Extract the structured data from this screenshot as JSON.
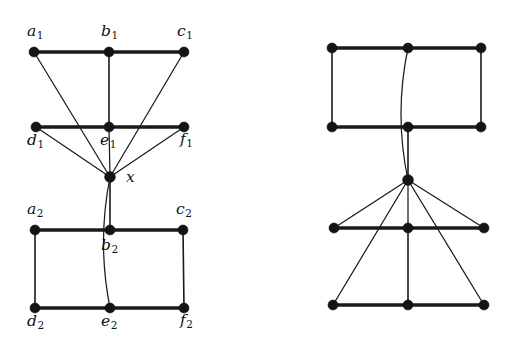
{
  "figure": {
    "background_color": "#ffffff",
    "ink_color": "#141414",
    "graphs": [
      {
        "id": "left-graph",
        "name": "labeled-graph",
        "labeled": true,
        "vertices": [
          {
            "id": "a1",
            "label": "a",
            "subscript": "1",
            "cx": 34,
            "cy": 52,
            "label_x": 27,
            "label_y": 24,
            "r": 5.0
          },
          {
            "id": "b1",
            "label": "b",
            "subscript": "1",
            "cx": 109,
            "cy": 52,
            "label_x": 101,
            "label_y": 24,
            "r": 5.0
          },
          {
            "id": "c1",
            "label": "c",
            "subscript": "1",
            "cx": 184,
            "cy": 52,
            "label_x": 177,
            "label_y": 24,
            "r": 5.0
          },
          {
            "id": "d1",
            "label": "d",
            "subscript": "1",
            "cx": 36,
            "cy": 127,
            "label_x": 27,
            "label_y": 133,
            "r": 5.0
          },
          {
            "id": "e1",
            "label": "e",
            "subscript": "1",
            "cx": 109,
            "cy": 127,
            "label_x": 100,
            "label_y": 133,
            "r": 5.0
          },
          {
            "id": "f1",
            "label": "f",
            "subscript": "1",
            "cx": 184,
            "cy": 127,
            "label_x": 180,
            "label_y": 132,
            "r": 5.0
          },
          {
            "id": "x",
            "label": "x",
            "subscript": "",
            "cx": 110,
            "cy": 177,
            "label_x": 126,
            "label_y": 170,
            "r": 5.4
          },
          {
            "id": "a2",
            "label": "a",
            "subscript": "2",
            "cx": 35,
            "cy": 230,
            "label_x": 27,
            "label_y": 202,
            "r": 5.0
          },
          {
            "id": "b2",
            "label": "b",
            "subscript": "2",
            "cx": 110,
            "cy": 230,
            "label_x": 101,
            "label_y": 238,
            "r": 5.0
          },
          {
            "id": "c2",
            "label": "c",
            "subscript": "2",
            "cx": 183,
            "cy": 230,
            "label_x": 176,
            "label_y": 202,
            "r": 5.0
          },
          {
            "id": "d2",
            "label": "d",
            "subscript": "2",
            "cx": 35,
            "cy": 308,
            "label_x": 27,
            "label_y": 314,
            "r": 5.0
          },
          {
            "id": "e2",
            "label": "e",
            "subscript": "2",
            "cx": 110,
            "cy": 308,
            "label_x": 101,
            "label_y": 314,
            "r": 5.0
          },
          {
            "id": "f2",
            "label": "f",
            "subscript": "2",
            "cx": 184,
            "cy": 308,
            "label_x": 180,
            "label_y": 313,
            "r": 5.0
          }
        ],
        "edges": [
          {
            "from": "a1",
            "to": "b1",
            "style": "thick",
            "shape": "line"
          },
          {
            "from": "b1",
            "to": "c1",
            "style": "thick",
            "shape": "line"
          },
          {
            "from": "b1",
            "to": "e1",
            "style": "medium",
            "shape": "line"
          },
          {
            "from": "d1",
            "to": "e1",
            "style": "thick",
            "shape": "line"
          },
          {
            "from": "e1",
            "to": "f1",
            "style": "thick",
            "shape": "line"
          },
          {
            "from": "a1",
            "to": "x",
            "style": "thin",
            "shape": "line"
          },
          {
            "from": "c1",
            "to": "x",
            "style": "thin",
            "shape": "line"
          },
          {
            "from": "d1",
            "to": "x",
            "style": "thin",
            "shape": "line"
          },
          {
            "from": "e1",
            "to": "x",
            "style": "thin",
            "shape": "line"
          },
          {
            "from": "f1",
            "to": "x",
            "style": "thin",
            "shape": "line"
          },
          {
            "from": "x",
            "to": "b2",
            "style": "medium",
            "shape": "line"
          },
          {
            "from": "x",
            "to": "e2",
            "style": "thin",
            "shape": "curve",
            "bow": -13
          },
          {
            "from": "a2",
            "to": "b2",
            "style": "thick",
            "shape": "line"
          },
          {
            "from": "b2",
            "to": "c2",
            "style": "thick",
            "shape": "line"
          },
          {
            "from": "a2",
            "to": "d2",
            "style": "medium",
            "shape": "line"
          },
          {
            "from": "c2",
            "to": "f2",
            "style": "medium",
            "shape": "line"
          },
          {
            "from": "d2",
            "to": "e2",
            "style": "thick",
            "shape": "line"
          },
          {
            "from": "e2",
            "to": "f2",
            "style": "thick",
            "shape": "line"
          }
        ]
      },
      {
        "id": "right-graph",
        "name": "unlabeled-graph",
        "labeled": false,
        "vertices": [
          {
            "id": "r_a1",
            "label": "",
            "subscript": "",
            "cx": 332,
            "cy": 48,
            "r": 5.0
          },
          {
            "id": "r_b1",
            "label": "",
            "subscript": "",
            "cx": 408,
            "cy": 48,
            "r": 5.0
          },
          {
            "id": "r_c1",
            "label": "",
            "subscript": "",
            "cx": 481,
            "cy": 48,
            "r": 5.0
          },
          {
            "id": "r_d1",
            "label": "",
            "subscript": "",
            "cx": 332,
            "cy": 127,
            "r": 5.0
          },
          {
            "id": "r_e1",
            "label": "",
            "subscript": "",
            "cx": 408,
            "cy": 127,
            "r": 5.0
          },
          {
            "id": "r_f1",
            "label": "",
            "subscript": "",
            "cx": 481,
            "cy": 127,
            "r": 5.0
          },
          {
            "id": "r_x",
            "label": "",
            "subscript": "",
            "cx": 408,
            "cy": 180,
            "r": 5.4
          },
          {
            "id": "r_a2",
            "label": "",
            "subscript": "",
            "cx": 334,
            "cy": 228,
            "r": 5.0
          },
          {
            "id": "r_b2",
            "label": "",
            "subscript": "",
            "cx": 408,
            "cy": 228,
            "r": 5.0
          },
          {
            "id": "r_c2",
            "label": "",
            "subscript": "",
            "cx": 484,
            "cy": 228,
            "r": 5.0
          },
          {
            "id": "r_d2",
            "label": "",
            "subscript": "",
            "cx": 333,
            "cy": 305,
            "r": 5.0
          },
          {
            "id": "r_e2",
            "label": "",
            "subscript": "",
            "cx": 408,
            "cy": 305,
            "r": 5.0
          },
          {
            "id": "r_f2",
            "label": "",
            "subscript": "",
            "cx": 484,
            "cy": 305,
            "r": 5.0
          }
        ],
        "edges": [
          {
            "from": "r_a1",
            "to": "r_b1",
            "style": "thick",
            "shape": "line"
          },
          {
            "from": "r_b1",
            "to": "r_c1",
            "style": "thick",
            "shape": "line"
          },
          {
            "from": "r_a1",
            "to": "r_d1",
            "style": "medium",
            "shape": "line"
          },
          {
            "from": "r_c1",
            "to": "r_f1",
            "style": "medium",
            "shape": "line"
          },
          {
            "from": "r_d1",
            "to": "r_e1",
            "style": "thick",
            "shape": "line"
          },
          {
            "from": "r_e1",
            "to": "r_f1",
            "style": "thick",
            "shape": "line"
          },
          {
            "from": "r_b1",
            "to": "r_x",
            "style": "thin",
            "shape": "curve",
            "bow": -14
          },
          {
            "from": "r_e1",
            "to": "r_x",
            "style": "medium",
            "shape": "line"
          },
          {
            "from": "r_x",
            "to": "r_a2",
            "style": "thin",
            "shape": "line"
          },
          {
            "from": "r_x",
            "to": "r_b2",
            "style": "thin",
            "shape": "line"
          },
          {
            "from": "r_x",
            "to": "r_c2",
            "style": "thin",
            "shape": "line"
          },
          {
            "from": "r_x",
            "to": "r_d2",
            "style": "thin",
            "shape": "line"
          },
          {
            "from": "r_x",
            "to": "r_f2",
            "style": "thin",
            "shape": "line"
          },
          {
            "from": "r_a2",
            "to": "r_b2",
            "style": "thick",
            "shape": "line"
          },
          {
            "from": "r_b2",
            "to": "r_c2",
            "style": "thick",
            "shape": "line"
          },
          {
            "from": "r_b2",
            "to": "r_e2",
            "style": "medium",
            "shape": "line"
          },
          {
            "from": "r_d2",
            "to": "r_e2",
            "style": "thick",
            "shape": "line"
          },
          {
            "from": "r_e2",
            "to": "r_f2",
            "style": "thick",
            "shape": "line"
          }
        ]
      }
    ]
  }
}
